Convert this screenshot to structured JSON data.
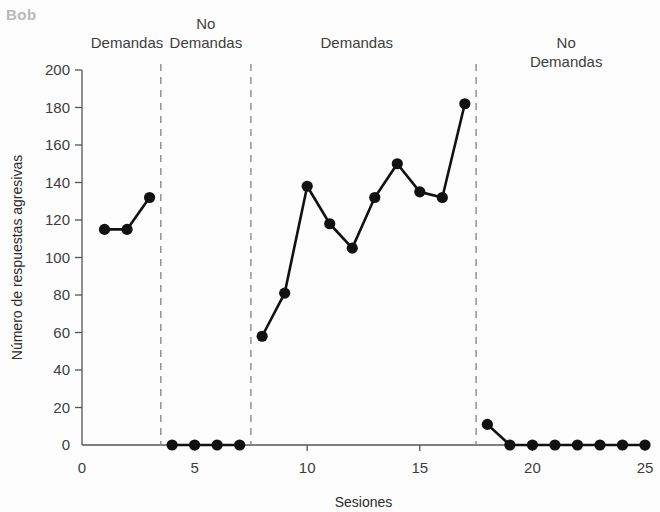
{
  "subject": {
    "label": "Bob"
  },
  "phases": [
    {
      "label": "Demandas",
      "center_session": 2.0,
      "condition": "demands"
    },
    {
      "label": "No\nDemandas",
      "center_session": 5.5,
      "condition": "no-demands"
    },
    {
      "label": "Demandas",
      "center_session": 12.2,
      "condition": "demands"
    },
    {
      "label": "No Demandas",
      "center_session": 21.5,
      "condition": "no-demands"
    }
  ],
  "phase_dividers": [
    3.5,
    7.5,
    17.5
  ],
  "colors": {
    "marker": "#111111",
    "line": "#111111",
    "axis": "#555555",
    "divider": "#8a8a8a",
    "subject_label": "#b9b9b9",
    "text": "#3d3d3d",
    "background": "#fdfdfd"
  },
  "chart_data": {
    "type": "line",
    "title": "Bob",
    "xlabel": "Sesiones",
    "ylabel": "Número de respuestas agresivas",
    "xlim": [
      0,
      25
    ],
    "ylim": [
      0,
      200
    ],
    "xticks": [
      0,
      5,
      10,
      15,
      20,
      25
    ],
    "xtick_labels": [
      "0",
      "5",
      "10",
      "15",
      "20",
      "25"
    ],
    "yticks": [
      0,
      20,
      40,
      60,
      80,
      100,
      120,
      140,
      160,
      180,
      200
    ],
    "ytick_labels": [
      "0",
      "20",
      "40",
      "60",
      "80",
      "100",
      "120",
      "140",
      "160",
      "180",
      "200"
    ],
    "grid": false,
    "legend": "none",
    "x": [
      1,
      2,
      3,
      4,
      5,
      6,
      7,
      8,
      9,
      10,
      11,
      12,
      13,
      14,
      15,
      16,
      17,
      18,
      19,
      20,
      21,
      22,
      23,
      24,
      25
    ],
    "values": [
      115,
      115,
      132,
      0,
      0,
      0,
      0,
      58,
      81,
      138,
      118,
      105,
      132,
      150,
      135,
      132,
      182,
      11,
      0,
      0,
      0,
      0,
      0,
      0,
      0
    ],
    "segments": [
      {
        "phase": "Demandas",
        "x": [
          1,
          2,
          3
        ],
        "values": [
          115,
          115,
          132
        ]
      },
      {
        "phase": "No Demandas",
        "x": [
          4,
          5,
          6,
          7
        ],
        "values": [
          0,
          0,
          0,
          0
        ]
      },
      {
        "phase": "Demandas",
        "x": [
          8,
          9,
          10,
          11,
          12,
          13,
          14,
          15,
          16,
          17
        ],
        "values": [
          58,
          81,
          138,
          118,
          105,
          132,
          150,
          135,
          132,
          182
        ]
      },
      {
        "phase": "No Demandas",
        "x": [
          18,
          19,
          20,
          21,
          22,
          23,
          24,
          25
        ],
        "values": [
          11,
          0,
          0,
          0,
          0,
          0,
          0,
          0
        ]
      }
    ]
  }
}
